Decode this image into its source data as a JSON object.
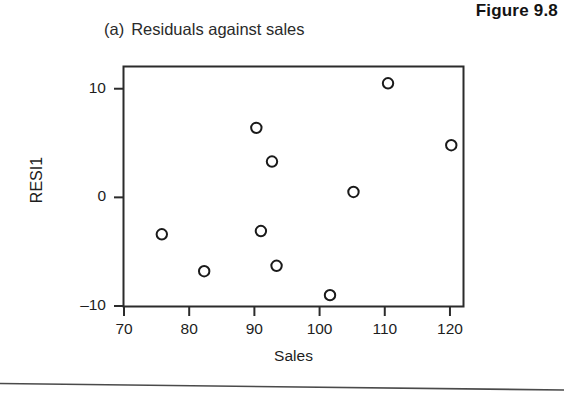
{
  "figure": {
    "number_label": "Figure 9.8",
    "panel_letter": "(a)",
    "panel_caption": "Residuals against sales"
  },
  "chart_data": {
    "type": "scatter",
    "xlabel": "Sales",
    "ylabel": "RESI1",
    "xlim": [
      70,
      122
    ],
    "ylim": [
      -10,
      12
    ],
    "xticks": [
      70,
      80,
      90,
      100,
      110,
      120
    ],
    "yticks": [
      10,
      0,
      -10
    ],
    "xtick_labels": [
      "70",
      "80",
      "90",
      "100",
      "110",
      "120"
    ],
    "ytick_labels": [
      "10",
      "0",
      "–10"
    ],
    "grid": false,
    "legend": null,
    "marker": "open-circle",
    "marker_color": "#1a1a1a",
    "points": [
      {
        "x": 75.8,
        "y": -3.4
      },
      {
        "x": 82.3,
        "y": -6.8
      },
      {
        "x": 90.3,
        "y": 6.4
      },
      {
        "x": 91.0,
        "y": -3.1
      },
      {
        "x": 92.7,
        "y": 3.3
      },
      {
        "x": 93.4,
        "y": -6.3
      },
      {
        "x": 101.6,
        "y": -9.0
      },
      {
        "x": 105.2,
        "y": 0.5
      },
      {
        "x": 110.5,
        "y": 10.5
      },
      {
        "x": 120.2,
        "y": 4.8
      }
    ]
  },
  "colors": {
    "ink": "#1a1a1a",
    "frame": "#2b2b2b",
    "page": "#ffffff"
  }
}
